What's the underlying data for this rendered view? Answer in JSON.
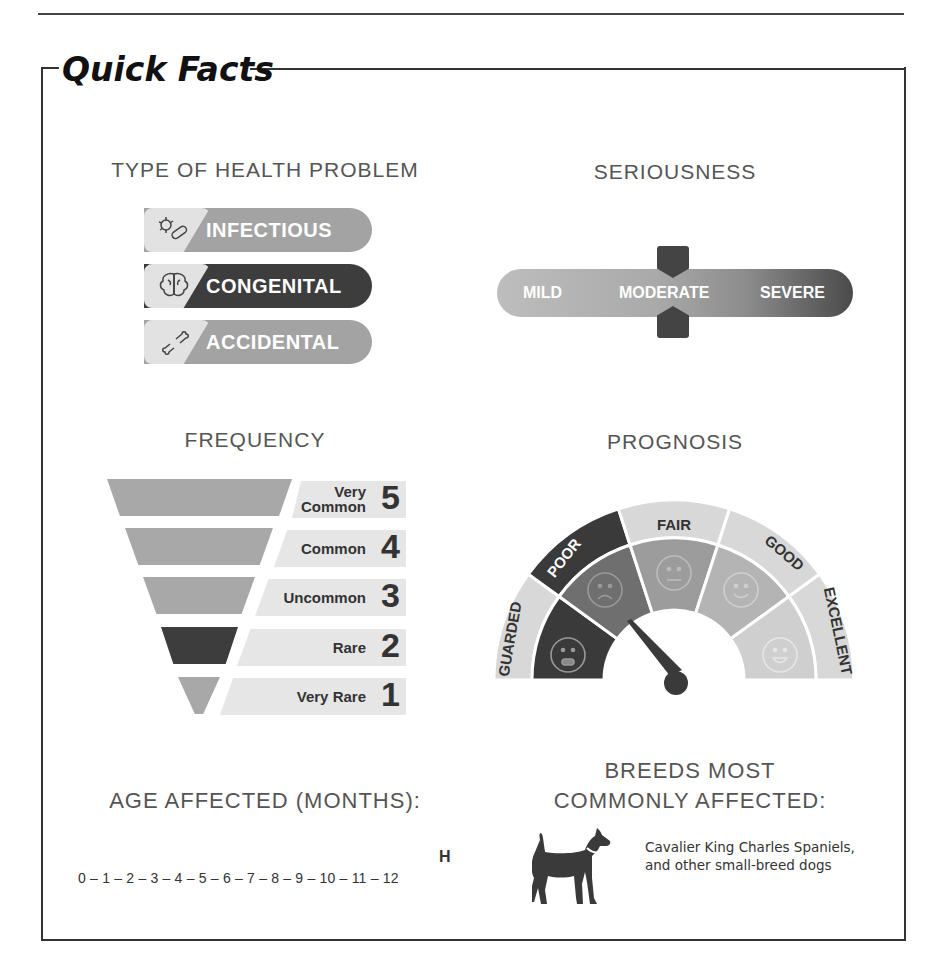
{
  "title": "Quick Facts",
  "type_of_health_problem": {
    "heading": "TYPE OF HEALTH PROBLEM",
    "items": [
      {
        "label": "INFECTIOUS",
        "icon": "germ-icon",
        "color": "#9e9e9e",
        "selected": false
      },
      {
        "label": "CONGENITAL",
        "icon": "brain-icon",
        "color": "#3d3d3d",
        "selected": true
      },
      {
        "label": "ACCIDENTAL",
        "icon": "broken-bone-icon",
        "color": "#9e9e9e",
        "selected": false
      }
    ]
  },
  "seriousness": {
    "heading": "SERIOUSNESS",
    "levels": [
      "MILD",
      "MODERATE",
      "SEVERE"
    ],
    "selected": "MODERATE"
  },
  "frequency": {
    "heading": "FREQUENCY",
    "levels": [
      {
        "label": "Very Common",
        "label_line1": "Very",
        "label_line2": "Common",
        "number": "5",
        "selected": false
      },
      {
        "label": "Common",
        "number": "4",
        "selected": false
      },
      {
        "label": "Uncommon",
        "number": "3",
        "selected": false
      },
      {
        "label": "Rare",
        "number": "2",
        "selected": true
      },
      {
        "label": "Very Rare",
        "number": "1",
        "selected": false
      }
    ]
  },
  "prognosis": {
    "heading": "PROGNOSIS",
    "segments": [
      {
        "label": "GUARDED",
        "face": "distressed-face-icon"
      },
      {
        "label": "POOR",
        "face": "sad-face-icon"
      },
      {
        "label": "FAIR",
        "face": "neutral-face-icon"
      },
      {
        "label": "GOOD",
        "face": "smile-face-icon"
      },
      {
        "label": "EXCELLENT",
        "face": "grin-face-icon"
      }
    ],
    "selected": "POOR"
  },
  "age_affected": {
    "heading": "AGE AFFECTED (MONTHS):",
    "scale": "0 – 1 – 2 – 3 – 4 – 5 – 6 – 7 – 8 – 9 – 10 – 11 – 12",
    "range_marker": "H",
    "range": "12"
  },
  "breeds": {
    "heading_line1": "BREEDS MOST",
    "heading_line2": "COMMONLY AFFECTED:",
    "icon": "dog-icon",
    "text": "Cavalier King Charles Spaniels, and other small-breed dogs"
  }
}
